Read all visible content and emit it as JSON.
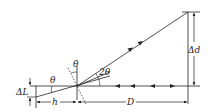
{
  "diagram": {
    "type": "optical lever / mirror reflection geometry",
    "labels": {
      "delta_L": "ΔL",
      "theta_left": "θ",
      "theta_top": "θ",
      "two_theta": "2θ",
      "h": "h",
      "D": "D",
      "delta_d": "Δd"
    },
    "colors": {
      "stroke": "#222222",
      "background": "#ffffff"
    }
  }
}
